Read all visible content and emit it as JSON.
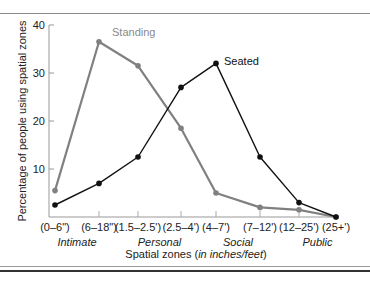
{
  "chart_data": {
    "type": "line",
    "title": "",
    "xlabel": "Spatial zones (in inches/feet)",
    "xlabel_main": "Spatial zones (",
    "xlabel_italic": "in inches/feet",
    "xlabel_close": ")",
    "ylabel": "Percentage of people using spatial zones",
    "ylim": [
      0,
      40
    ],
    "yticks": [
      10,
      20,
      30,
      40
    ],
    "grid": false,
    "legend_position": "inline labels",
    "categories": [
      "(0–6\")",
      "(6–18\")",
      "(1.5–2.5')",
      "(2.5–4')",
      "(4–7')",
      "(7–12')",
      "(12–25')",
      "(25+')"
    ],
    "zones": [
      {
        "label": "Intimate",
        "span": [
          0,
          1
        ]
      },
      {
        "label": "Personal",
        "span": [
          2,
          3
        ]
      },
      {
        "label": "Social",
        "span": [
          4,
          5
        ]
      },
      {
        "label": "Public",
        "span": [
          6,
          7
        ]
      }
    ],
    "series": [
      {
        "name": "Standing",
        "color": "#808080",
        "values": [
          5.5,
          36.5,
          31.5,
          18.5,
          5,
          2,
          1.5,
          0
        ]
      },
      {
        "name": "Seated",
        "color": "#111111",
        "values": [
          2.5,
          7,
          12.5,
          27,
          32,
          12.5,
          3,
          0
        ]
      }
    ]
  },
  "layout": {
    "x_pixels": [
      55,
      99,
      138,
      181,
      216,
      260,
      299,
      336
    ],
    "y_zero_px": 217,
    "px_per_unit": 4.8
  }
}
